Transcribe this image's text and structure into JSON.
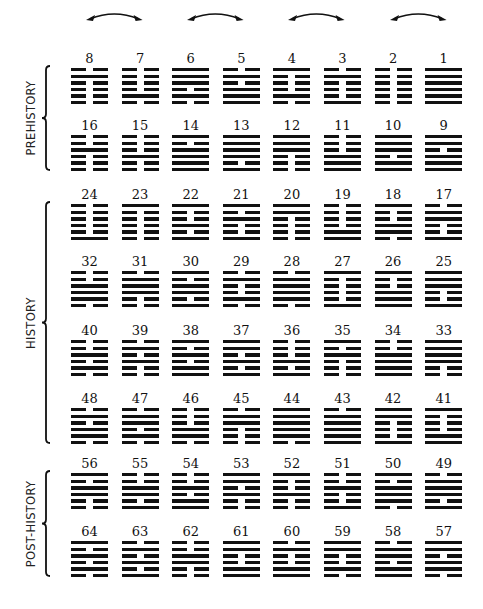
{
  "diagram": {
    "type": "king-wen-hexagram-sequence",
    "colors": {
      "ink": "#111111",
      "background": "#ffffff"
    },
    "arrows": [
      {
        "connects": [
          "8",
          "7"
        ]
      },
      {
        "connects": [
          "6",
          "5"
        ]
      },
      {
        "connects": [
          "4",
          "3"
        ]
      },
      {
        "connects": [
          "2",
          "1"
        ]
      }
    ],
    "sections": [
      {
        "label": "PREHISTORY",
        "rows": [
          0,
          1
        ]
      },
      {
        "label": "HISTORY",
        "rows": [
          2,
          3,
          4,
          5
        ]
      },
      {
        "label": "POST-HISTORY",
        "rows": [
          6,
          7
        ]
      }
    ],
    "rows": [
      [
        8,
        7,
        6,
        5,
        4,
        3,
        2,
        1
      ],
      [
        16,
        15,
        14,
        13,
        12,
        11,
        10,
        9
      ],
      [
        24,
        23,
        22,
        21,
        20,
        19,
        18,
        17
      ],
      [
        32,
        31,
        30,
        29,
        28,
        27,
        26,
        25
      ],
      [
        40,
        39,
        38,
        37,
        36,
        35,
        34,
        33
      ],
      [
        48,
        47,
        46,
        45,
        44,
        43,
        42,
        41
      ],
      [
        56,
        55,
        54,
        53,
        52,
        51,
        50,
        49
      ],
      [
        64,
        63,
        62,
        61,
        60,
        59,
        58,
        57
      ]
    ],
    "hexagrams_top_to_bottom": {
      "1": "111111",
      "2": "000000",
      "3": "010001",
      "4": "100010",
      "5": "010111",
      "6": "111010",
      "7": "000010",
      "8": "010000",
      "9": "110111",
      "10": "111011",
      "11": "000111",
      "12": "111000",
      "13": "111101",
      "14": "101111",
      "15": "000100",
      "16": "001000",
      "17": "011001",
      "18": "100110",
      "19": "000011",
      "20": "110000",
      "21": "101001",
      "22": "100101",
      "23": "100000",
      "24": "000001",
      "25": "111001",
      "26": "100111",
      "27": "100001",
      "28": "011110",
      "29": "010010",
      "30": "101101",
      "31": "011100",
      "32": "001110",
      "33": "111100",
      "34": "001111",
      "35": "101000",
      "36": "000101",
      "37": "110101",
      "38": "101011",
      "39": "010100",
      "40": "001010",
      "41": "100011",
      "42": "110001",
      "43": "011111",
      "44": "111110",
      "45": "011000",
      "46": "000110",
      "47": "011010",
      "48": "010110",
      "49": "011101",
      "50": "101110",
      "51": "001001",
      "52": "100100",
      "53": "110100",
      "54": "001011",
      "55": "001101",
      "56": "101100",
      "57": "110110",
      "58": "011011",
      "59": "110010",
      "60": "010011",
      "61": "110011",
      "62": "001100",
      "63": "010101",
      "64": "101010"
    }
  }
}
